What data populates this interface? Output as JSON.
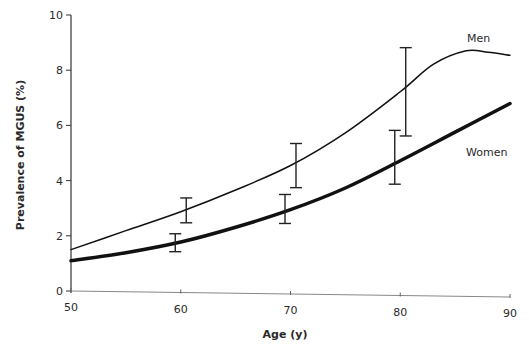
{
  "chart_data": {
    "type": "line",
    "title": "",
    "xlabel": "Age (y)",
    "ylabel": "Prevalence of MGUS (%)",
    "xlim": [
      50,
      90
    ],
    "ylim": [
      0,
      10
    ],
    "x_ticks": [
      50,
      60,
      70,
      80,
      90
    ],
    "y_ticks": [
      0,
      2,
      4,
      6,
      8,
      10
    ],
    "grid": false,
    "legend_position": "inline labels at right",
    "series": [
      {
        "name": "Men",
        "line_width": 1.5,
        "x": [
          50,
          55,
          60,
          65,
          70,
          75,
          80,
          83,
          86,
          88,
          90
        ],
        "values": [
          1.5,
          2.2,
          2.9,
          3.7,
          4.6,
          5.8,
          7.3,
          8.3,
          8.8,
          8.75,
          8.65
        ],
        "error_bars": [
          {
            "x": 60.5,
            "center": 2.9,
            "low": 2.5,
            "high": 3.4
          },
          {
            "x": 70.5,
            "center": 4.6,
            "low": 3.8,
            "high": 5.4
          },
          {
            "x": 80.5,
            "center": 7.35,
            "low": 5.7,
            "high": 8.9
          }
        ]
      },
      {
        "name": "Women",
        "line_width": 3.5,
        "x": [
          50,
          55,
          60,
          65,
          70,
          75,
          80,
          85,
          90
        ],
        "values": [
          1.1,
          1.4,
          1.8,
          2.35,
          3.0,
          3.8,
          4.8,
          5.85,
          6.9
        ],
        "error_bars": [
          {
            "x": 59.5,
            "center": 1.8,
            "low": 1.45,
            "high": 2.1
          },
          {
            "x": 69.5,
            "center": 3.0,
            "low": 2.5,
            "high": 3.55
          },
          {
            "x": 79.5,
            "center": 4.75,
            "low": 3.95,
            "high": 5.9
          }
        ]
      }
    ],
    "annotations": [
      {
        "text": "Men",
        "near": "end of Men curve, above"
      },
      {
        "text": "Women",
        "near": "below end of Women curve"
      }
    ]
  },
  "labels": {
    "xlabel": "Age (y)",
    "ylabel": "Prevalence of MGUS (%)",
    "men": "Men",
    "women": "Women"
  }
}
